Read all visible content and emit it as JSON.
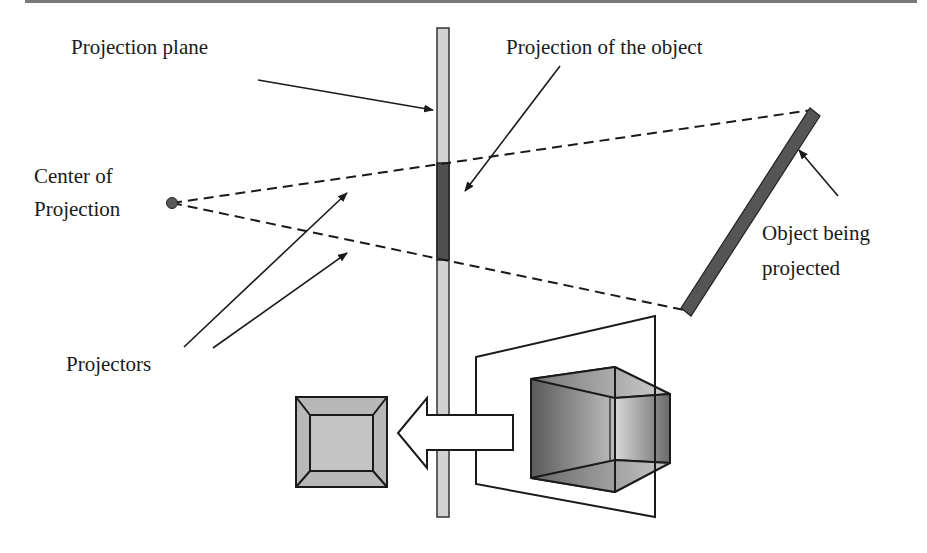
{
  "diagram": {
    "labels": {
      "projection_plane": "Projection plane",
      "projection_of_object": "Projection of the object",
      "center_line1": "Center of",
      "center_line2": "Projection",
      "object_line1": "Object being",
      "object_line2": "projected",
      "projectors": "Projectors"
    },
    "colors": {
      "plane_fill": "#d2d2d2",
      "plane_projection_fill": "#505050",
      "object_fill": "#555555",
      "stroke": "#1a1a1a",
      "point_fill": "#5a5a5a",
      "square_outer": "#b8b8b8",
      "square_inner": "#c4c4c4",
      "top_rule": "#7a7a7a"
    },
    "elements": [
      {
        "id": "center-of-projection",
        "type": "point",
        "x": 172,
        "y": 203
      },
      {
        "id": "projection-plane",
        "type": "bar",
        "x": 437,
        "y": 28,
        "w": 12,
        "h": 489
      },
      {
        "id": "projected-segment",
        "type": "bar",
        "x": 437,
        "y": 163,
        "w": 12,
        "h": 97
      },
      {
        "id": "object",
        "type": "thick-line",
        "from": [
          815,
          112
        ],
        "to": [
          686,
          312
        ]
      },
      {
        "id": "projector-top",
        "type": "dashed-line",
        "from": [
          172,
          203
        ],
        "to": [
          812,
          110
        ]
      },
      {
        "id": "projector-bottom",
        "type": "dashed-line",
        "from": [
          172,
          203
        ],
        "to": [
          684,
          310
        ]
      }
    ]
  }
}
